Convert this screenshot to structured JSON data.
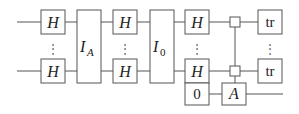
{
  "diagram": {
    "type": "quantum-circuit",
    "gates": {
      "h": "H",
      "ia_main": "I",
      "ia_sub": "A",
      "i0_main": "I",
      "i0_sub": "0",
      "zero": "0",
      "a": "A",
      "tr": "tr"
    },
    "vdots": "⋮"
  }
}
